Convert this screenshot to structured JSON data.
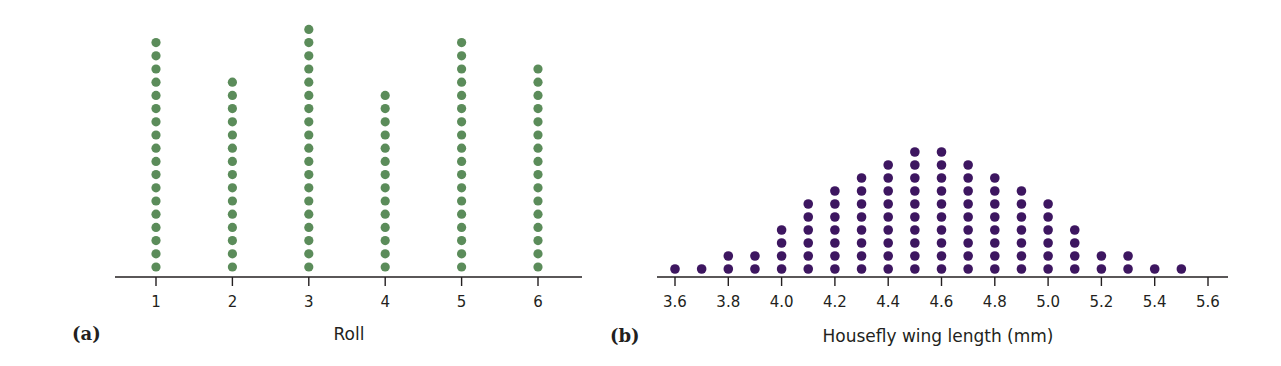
{
  "chart_data": [
    {
      "panel": "(a)",
      "type": "scatter",
      "subtype": "dot-plot",
      "title": "",
      "xlabel": "Roll",
      "ylabel": "",
      "categories": [
        "1",
        "2",
        "3",
        "4",
        "5",
        "6"
      ],
      "values": [
        18,
        15,
        19,
        14,
        18,
        16
      ],
      "dot_color": "#5b8c5a",
      "grid": false
    },
    {
      "panel": "(b)",
      "type": "scatter",
      "subtype": "dot-plot",
      "title": "",
      "xlabel": "Housefly wing length (mm)",
      "ylabel": "",
      "x": [
        3.6,
        3.7,
        3.8,
        3.9,
        4.0,
        4.1,
        4.2,
        4.3,
        4.4,
        4.5,
        4.6,
        4.7,
        4.8,
        4.9,
        5.0,
        5.1,
        5.2,
        5.3,
        5.4,
        5.5
      ],
      "values": [
        1,
        1,
        2,
        2,
        4,
        6,
        7,
        8,
        9,
        10,
        10,
        9,
        8,
        7,
        6,
        4,
        2,
        2,
        1,
        1
      ],
      "tick_labels": [
        "3.6",
        "3.8",
        "4.0",
        "4.2",
        "4.4",
        "4.6",
        "4.8",
        "5.0",
        "5.2",
        "5.4",
        "5.6"
      ],
      "xlim": [
        3.6,
        5.6
      ],
      "dot_color": "#3d1660",
      "grid": false
    }
  ],
  "panels": {
    "a": {
      "label": "(a)",
      "axis_title": "Roll"
    },
    "b": {
      "label": "(b)",
      "axis_title": "Housefly wing length (mm)"
    }
  }
}
